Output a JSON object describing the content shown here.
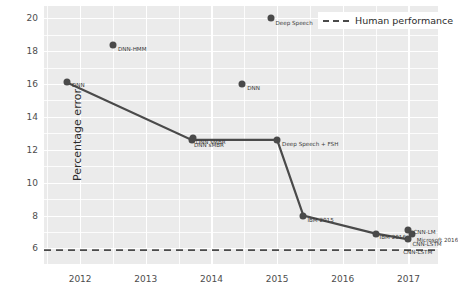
{
  "chart_data": {
    "type": "line",
    "title": "",
    "xlabel": "",
    "ylabel": "Percentage error",
    "xlim": [
      2011.45,
      2017.45
    ],
    "ylim": [
      5.05,
      20.75
    ],
    "yticks": [
      6,
      8,
      10,
      12,
      14,
      16,
      18,
      20
    ],
    "xticks": [
      2012,
      2013,
      2014,
      2015,
      2016,
      2017
    ],
    "grid": true,
    "legend_position": "top-right",
    "legend": [
      {
        "label": "Human performance",
        "style": "dashed",
        "color": "#4a4a4a"
      }
    ],
    "human_performance_line": {
      "value": 5.9,
      "label": "Human performance"
    },
    "series": [
      {
        "name": "Best system progression",
        "style": "line-with-markers",
        "color": "#4a4a4a",
        "points": [
          {
            "x": 2011.8,
            "y": 16.1,
            "label": "DNN"
          },
          {
            "x": 2013.7,
            "y": 12.6,
            "label": "DNN sMBR"
          },
          {
            "x": 2015.0,
            "y": 12.6,
            "label": "Deep Speech + FSH"
          },
          {
            "x": 2015.4,
            "y": 8.0,
            "label": "IBM 2015"
          },
          {
            "x": 2016.5,
            "y": 6.9,
            "label": "IBM 2016"
          },
          {
            "x": 2017.0,
            "y": 6.55,
            "label": "CNN-LSTM"
          }
        ]
      },
      {
        "name": "Other systems",
        "style": "markers",
        "color": "#4a4a4a",
        "points": [
          {
            "x": 2012.5,
            "y": 18.4,
            "label": "DNN-HMM"
          },
          {
            "x": 2014.9,
            "y": 20.0,
            "label": "Deep Speech"
          },
          {
            "x": 2014.47,
            "y": 16.0,
            "label": "DNN"
          },
          {
            "x": 2013.72,
            "y": 12.7,
            "label": "DNN sMBR"
          },
          {
            "x": 2017.0,
            "y": 7.1,
            "label": "CNN-LM"
          },
          {
            "x": 2017.05,
            "y": 6.85,
            "label": "Microsoft 2016"
          }
        ]
      }
    ],
    "annotations": [
      {
        "text": "DNN",
        "x": 2011.8,
        "y": 16.1
      },
      {
        "text": "DNN-HMM",
        "x": 2012.5,
        "y": 18.4
      },
      {
        "text": "DNN sMBR",
        "x": 2013.7,
        "y": 12.6
      },
      {
        "text": "DNN sMBR",
        "x": 2013.72,
        "y": 12.7
      },
      {
        "text": "DNN",
        "x": 2014.47,
        "y": 16.0
      },
      {
        "text": "Deep Speech",
        "x": 2014.9,
        "y": 20.0
      },
      {
        "text": "Deep Speech + FSH",
        "x": 2015.0,
        "y": 12.6
      },
      {
        "text": "IBM 2015",
        "x": 2015.4,
        "y": 8.0
      },
      {
        "text": "IBM 2016",
        "x": 2016.5,
        "y": 6.9
      },
      {
        "text": "CNN-LM",
        "x": 2017.0,
        "y": 7.1
      },
      {
        "text": "CNN-LSTM",
        "x": 2017.0,
        "y": 6.55
      },
      {
        "text": "Microsoft 2016",
        "x": 2017.05,
        "y": 6.85
      },
      {
        "text": "CNN-LSTM",
        "x": 2016.95,
        "y": 6.5
      }
    ]
  },
  "axis": {
    "ylabel": "Percentage error",
    "ytick_labels": [
      "6",
      "8",
      "10",
      "12",
      "14",
      "16",
      "18",
      "20"
    ],
    "xtick_labels": [
      "2012",
      "2013",
      "2014",
      "2015",
      "2016",
      "2017"
    ]
  },
  "legend": {
    "human_performance_label": "Human performance"
  },
  "labels": {
    "dnn_2011": "DNN",
    "dnn_hmm": "DNN-HMM",
    "dnn_smbr_a": "DNN sMBR",
    "dnn_smbr_b": "DNN sMBR",
    "dnn_2014": "DNN",
    "deep_speech": "Deep Speech",
    "deep_speech_fsh": "Deep Speech + FSH",
    "ibm_2015": "IBM 2015",
    "ibm_2016": "IBM 2016",
    "cnn_lm": "CNN-LM",
    "cnn_lstm_a": "CNN-LSTM",
    "microsoft_2016": "Microsoft 2016",
    "cnn_lstm_b": "CNN-LSTM"
  },
  "colors": {
    "panel": "#ebebeb",
    "grid": "#ffffff",
    "marker": "#4a4a4a",
    "line": "#4a4a4a",
    "text": "#2b2b2b"
  }
}
